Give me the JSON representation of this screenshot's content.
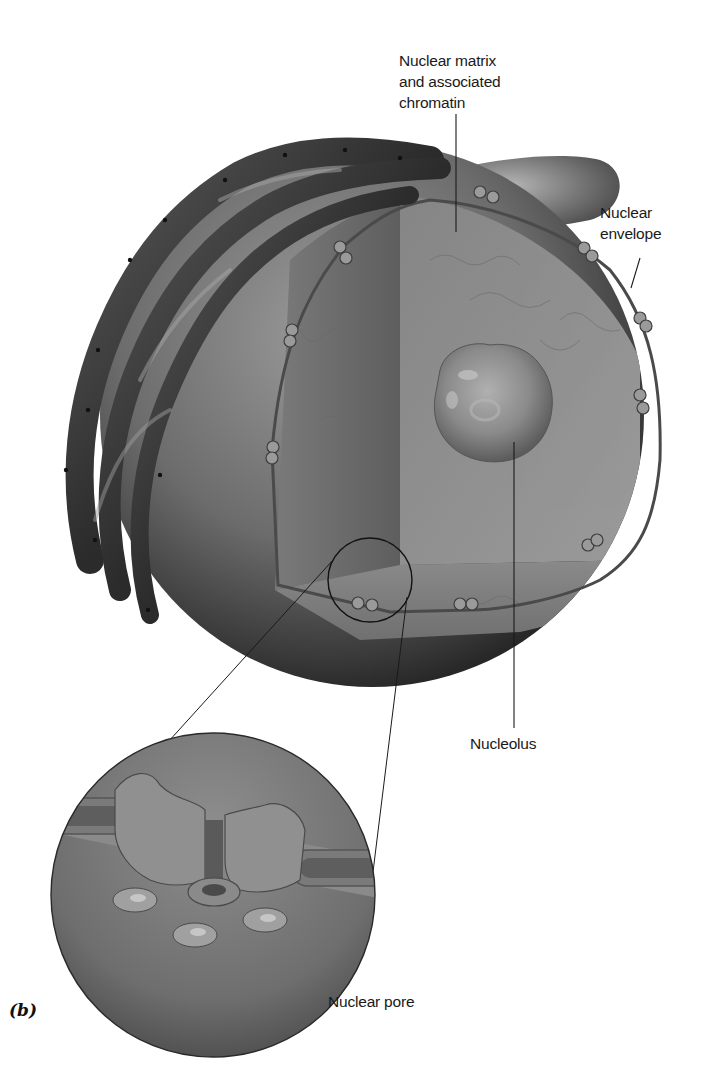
{
  "figure": {
    "panel_label": "(b)",
    "colors": {
      "background": "#ffffff",
      "sphere_light": "#8e8e8e",
      "sphere_dark": "#2a2a2a",
      "interior": "#7c7c7c",
      "nucleolus": "#8a8a8a",
      "er": "#3a3a3a",
      "leader_line": "#1a1a1a"
    }
  },
  "labels": {
    "nuclear_matrix": "Nuclear matrix\nand associated\nchromatin",
    "nuclear_envelope": "Nuclear\nenvelope",
    "nucleolus": "Nucleolus",
    "nuclear_pore": "Nuclear pore"
  }
}
